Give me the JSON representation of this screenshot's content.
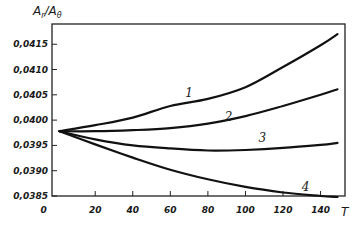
{
  "chart_data": {
    "type": "line",
    "title": "",
    "xlabel": "T",
    "ylabel": "A_r / A_θ",
    "ylabel_main": "A",
    "ylabel_sub1": "r",
    "ylabel_slash": "/A",
    "ylabel_sub2": "θ",
    "xlim": [
      -3,
      153
    ],
    "ylim": [
      0.0385,
      0.0419
    ],
    "grid": false,
    "legend": "inline curve numbers",
    "x_ticks": [
      0,
      20,
      40,
      60,
      80,
      100,
      120,
      140
    ],
    "x_tick_labels": [
      "0",
      "20",
      "40",
      "60",
      "80",
      "100",
      "120",
      "140"
    ],
    "y_ticks": [
      0.0385,
      0.039,
      0.0395,
      0.04,
      0.0405,
      0.041,
      0.0415
    ],
    "y_tick_labels": [
      "0,0385",
      "0,0390",
      "0,0395",
      "0,0400",
      "0,0405",
      "0,0410",
      "0,0415"
    ],
    "x": [
      1,
      20,
      40,
      60,
      80,
      100,
      120,
      140,
      149
    ],
    "series": [
      {
        "name": "1",
        "values": [
          0.03978,
          0.0399,
          0.04005,
          0.04028,
          0.04042,
          0.04065,
          0.04105,
          0.04148,
          0.0417
        ],
        "label_pos": [
          70,
          0.04045
        ]
      },
      {
        "name": "2",
        "values": [
          0.03978,
          0.03978,
          0.0398,
          0.03984,
          0.03993,
          0.04008,
          0.04028,
          0.0405,
          0.04061
        ],
        "label_pos": [
          91,
          0.03998
        ]
      },
      {
        "name": "3",
        "values": [
          0.03978,
          0.03962,
          0.0395,
          0.03944,
          0.0394,
          0.03941,
          0.03945,
          0.03951,
          0.03955
        ],
        "label_pos": [
          109,
          0.03956
        ]
      },
      {
        "name": "4",
        "values": [
          0.03978,
          0.03952,
          0.03926,
          0.03902,
          0.03883,
          0.03868,
          0.03857,
          0.0385,
          0.03848
        ],
        "label_pos": [
          132,
          0.0386
        ]
      }
    ]
  }
}
